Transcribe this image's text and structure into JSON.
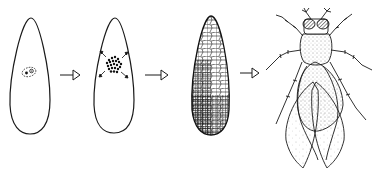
{
  "diagram": {
    "type": "developmental-sequence",
    "background": "#ffffff",
    "stroke_color": "#1a1a1a",
    "stages": [
      {
        "id": "egg-single-nucleus",
        "icon": "egg-with-nucleus"
      },
      {
        "id": "egg-dividing-nuclei",
        "icon": "egg-with-dividing-nuclei"
      },
      {
        "id": "cellular-blastoderm",
        "icon": "egg-cellularized"
      },
      {
        "id": "adult-fly",
        "icon": "fruit-fly"
      }
    ],
    "arrows": [
      {
        "from": "egg-single-nucleus",
        "to": "egg-dividing-nuclei"
      },
      {
        "from": "egg-dividing-nuclei",
        "to": "cellular-blastoderm"
      },
      {
        "from": "cellular-blastoderm",
        "to": "adult-fly"
      }
    ]
  }
}
